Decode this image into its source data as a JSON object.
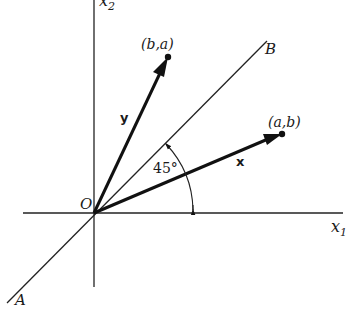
{
  "diagram": {
    "axes": {
      "x1_label": "x",
      "x1_sub": "1",
      "x2_label": "x",
      "x2_sub": "2",
      "origin_label": "O"
    },
    "line": {
      "end_label_upper": "B",
      "end_label_lower": "A"
    },
    "vectors": [
      {
        "name": "x",
        "label": "x",
        "tip_label": "(a,b)"
      },
      {
        "name": "y",
        "label": "y",
        "tip_label": "(b,a)"
      }
    ],
    "angle": {
      "label": "45°"
    }
  }
}
